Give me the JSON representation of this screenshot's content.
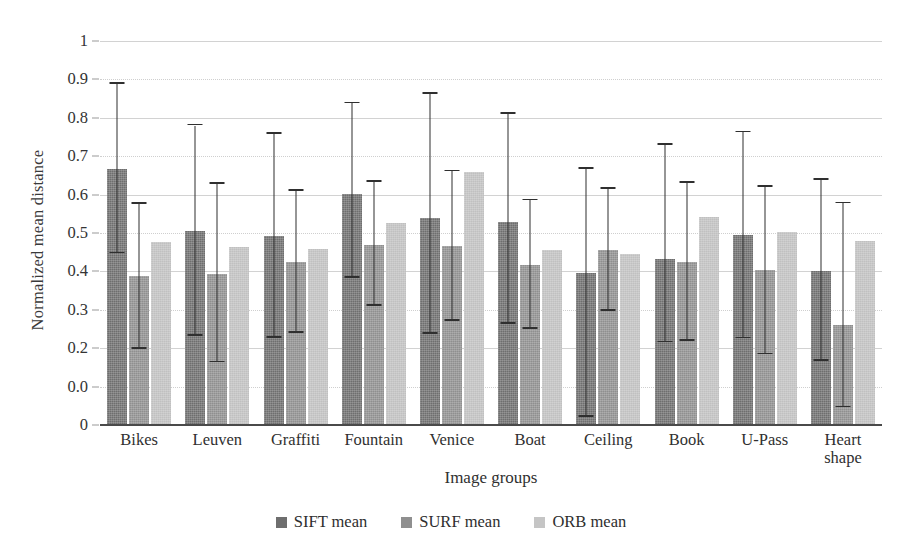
{
  "chart_data": {
    "type": "bar",
    "title": "",
    "xlabel": "Image groups",
    "ylabel": "Normalized mean distance",
    "ylim": [
      0,
      1.0
    ],
    "grid": true,
    "legend_position": "bottom",
    "categories": [
      "Bikes",
      "Leuven",
      "Graffiti",
      "Fountain",
      "Venice",
      "Boat",
      "Ceiling",
      "Book",
      "U-Pass",
      "Heart shape"
    ],
    "ytick_labels": [
      "1",
      "0.9",
      "0.8",
      "0.7",
      "0.6",
      "0.5",
      "0.4",
      "0.3",
      "0.2",
      "0.0",
      "0"
    ],
    "ytick_values": [
      1.0,
      0.9,
      0.8,
      0.7,
      0.6,
      0.5,
      0.4,
      0.3,
      0.2,
      0.1,
      0.0
    ],
    "series": [
      {
        "name": "SIFT mean",
        "color": "#6e6e6e",
        "values": [
          0.667,
          0.505,
          0.492,
          0.602,
          0.538,
          0.529,
          0.397,
          0.433,
          0.494,
          0.401
        ],
        "err_low": [
          0.447,
          0.232,
          0.227,
          0.383,
          0.237,
          0.263,
          0.021,
          0.215,
          0.226,
          0.168
        ],
        "err_high": [
          0.888,
          0.78,
          0.758,
          0.838,
          0.862,
          0.81,
          0.668,
          0.73,
          0.762,
          0.639
        ]
      },
      {
        "name": "SURF mean",
        "color": "#8f8f8f",
        "values": [
          0.388,
          0.394,
          0.424,
          0.47,
          0.466,
          0.417,
          0.456,
          0.424,
          0.403,
          0.26
        ],
        "err_low": [
          0.199,
          0.163,
          0.24,
          0.31,
          0.271,
          0.251,
          0.298,
          0.219,
          0.184,
          0.046
        ],
        "err_high": [
          0.576,
          0.628,
          0.61,
          0.633,
          0.661,
          0.585,
          0.615,
          0.631,
          0.621,
          0.577
        ]
      },
      {
        "name": "ORB mean",
        "color": "#c0c0c0",
        "values": [
          0.477,
          0.463,
          0.459,
          0.525,
          0.66,
          0.456,
          0.446,
          0.543,
          0.503,
          0.479
        ]
      }
    ]
  },
  "legend": {
    "items": [
      {
        "label": "SIFT mean",
        "swatch": "legend-swatch-sift"
      },
      {
        "label": "SURF mean",
        "swatch": "legend-swatch-surf"
      },
      {
        "label": "ORB mean",
        "swatch": "legend-swatch-orb"
      }
    ]
  }
}
